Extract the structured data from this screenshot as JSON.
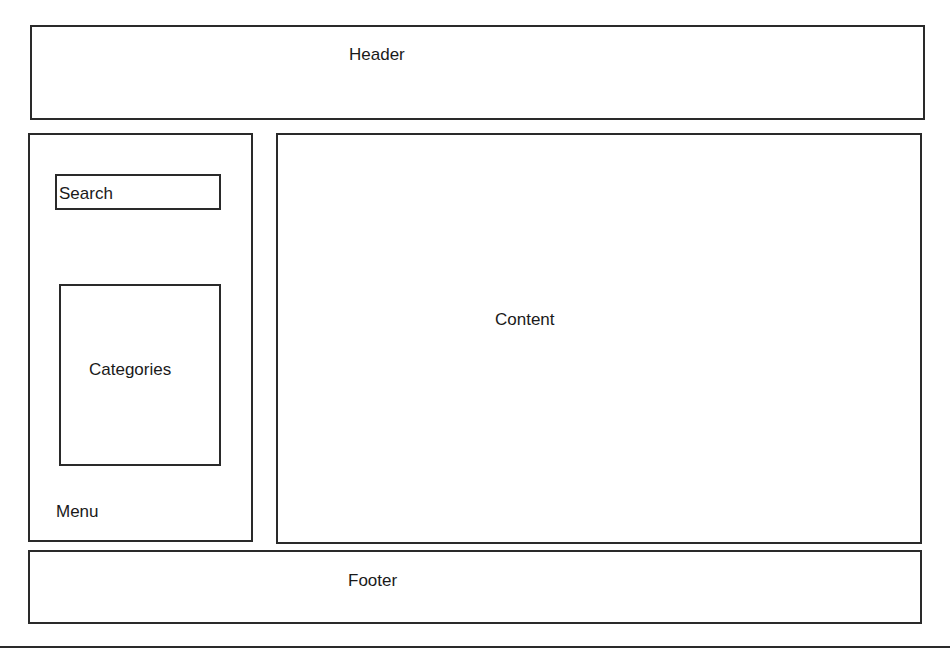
{
  "diagram": {
    "type": "website-layout-wireframe",
    "header": {
      "label": "Header"
    },
    "sidebar": {
      "search": {
        "label": "Search"
      },
      "categories": {
        "label": "Categories"
      },
      "menu": {
        "label": "Menu"
      }
    },
    "content": {
      "label": "Content"
    },
    "footer": {
      "label": "Footer"
    }
  },
  "colors": {
    "border": "#2a2a2a",
    "background": "#ffffff",
    "text": "#1a1a1a"
  }
}
